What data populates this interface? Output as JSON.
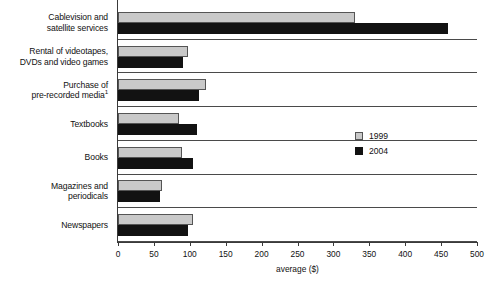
{
  "chart_data": {
    "type": "bar",
    "orientation": "horizontal",
    "title": "",
    "xlabel": "average ($)",
    "ylabel": "",
    "xlim": [
      0,
      500
    ],
    "xticks": [
      0,
      50,
      100,
      150,
      200,
      250,
      300,
      350,
      400,
      450,
      500
    ],
    "xtick_labels": [
      "0",
      "50",
      "100",
      "150",
      "200",
      "250",
      "300",
      "350",
      "400",
      "450",
      "500"
    ],
    "grid": false,
    "legend_position": "center-right",
    "categories": [
      "Cablevision and satellite services",
      "Rental of videotapes, DVDs and video games",
      "Purchase of pre-recorded media¹",
      "Textbooks",
      "Books",
      "Magazines and periodicals",
      "Newspapers"
    ],
    "category_lines": [
      [
        "Cablevision and",
        "satellite services"
      ],
      [
        "Rental of videotapes,",
        "DVDs and video games"
      ],
      [
        "Purchase of",
        "pre-recorded media",
        "1"
      ],
      [
        "Textbooks"
      ],
      [
        "Books"
      ],
      [
        "Magazines and",
        "periodicals"
      ],
      [
        "Newspapers"
      ]
    ],
    "series": [
      {
        "name": "1999",
        "color": "#c9c9c9",
        "values": [
          330,
          97,
          122,
          85,
          89,
          61,
          105
        ]
      },
      {
        "name": "2004",
        "color": "#121212",
        "values": [
          460,
          90,
          113,
          110,
          104,
          58,
          97
        ]
      }
    ]
  },
  "legend": {
    "items": [
      {
        "label": "1999",
        "key": "y1999"
      },
      {
        "label": "2004",
        "key": "y2004"
      }
    ]
  }
}
